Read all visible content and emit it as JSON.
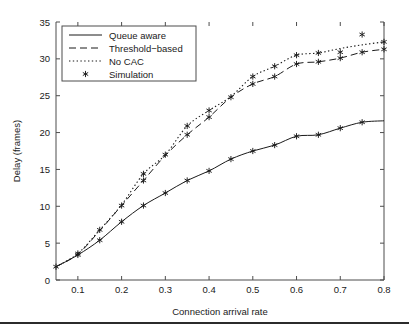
{
  "figure": {
    "background": "#ffffff",
    "foreground": "#1a1a1a",
    "footer_rule_color": "#2b2b2b"
  },
  "chart_data": {
    "type": "line",
    "title": "",
    "xlabel": "Connection arrival rate",
    "ylabel": "Delay (frames)",
    "xlim": [
      0.05,
      0.8
    ],
    "ylim": [
      0,
      35
    ],
    "xticks": [
      0.1,
      0.2,
      0.3,
      0.4,
      0.5,
      0.6,
      0.7,
      0.8
    ],
    "xticklabels": [
      "0.1",
      "0.2",
      "0.3",
      "0.4",
      "0.5",
      "0.6",
      "0.7",
      "0.8"
    ],
    "yticks": [
      0,
      5,
      10,
      15,
      20,
      25,
      30,
      35
    ],
    "yticklabels": [
      "0",
      "5",
      "10",
      "15",
      "20",
      "25",
      "30",
      "35"
    ],
    "grid": false,
    "legend_position": "upper left",
    "x": [
      0.05,
      0.1,
      0.15,
      0.2,
      0.25,
      0.3,
      0.35,
      0.4,
      0.45,
      0.5,
      0.55,
      0.6,
      0.65,
      0.7,
      0.75,
      0.8
    ],
    "series": [
      {
        "name": "Queue aware",
        "style": "solid",
        "color": "#1a1a1a",
        "values": [
          1.8,
          3.4,
          5.4,
          7.9,
          10.1,
          11.8,
          13.5,
          14.8,
          16.4,
          17.5,
          18.3,
          19.5,
          19.7,
          20.6,
          21.4,
          21.6
        ]
      },
      {
        "name": "Threshold-based",
        "style": "dashed",
        "color": "#1a1a1a",
        "values": [
          1.8,
          3.5,
          6.7,
          10.1,
          13.5,
          16.9,
          19.7,
          22.1,
          24.8,
          26.6,
          27.6,
          29.3,
          29.6,
          30.1,
          30.9,
          31.3
        ]
      },
      {
        "name": "No CAC",
        "style": "dotted",
        "color": "#1a1a1a",
        "values": [
          1.8,
          3.6,
          6.8,
          10.2,
          14.4,
          17.0,
          20.9,
          23.0,
          24.9,
          27.6,
          29.0,
          30.5,
          30.8,
          31.4,
          31.9,
          32.3
        ]
      },
      {
        "name": "Simulation",
        "style": "marker",
        "marker": "asterisk",
        "color": "#1a1a1a",
        "points": [
          {
            "x": 0.05,
            "y": 1.8
          },
          {
            "x": 0.1,
            "y": 3.4
          },
          {
            "x": 0.1,
            "y": 3.6
          },
          {
            "x": 0.15,
            "y": 5.4
          },
          {
            "x": 0.15,
            "y": 6.8
          },
          {
            "x": 0.2,
            "y": 7.9
          },
          {
            "x": 0.2,
            "y": 10.1
          },
          {
            "x": 0.25,
            "y": 10.1
          },
          {
            "x": 0.25,
            "y": 13.5
          },
          {
            "x": 0.25,
            "y": 14.4
          },
          {
            "x": 0.3,
            "y": 11.8
          },
          {
            "x": 0.3,
            "y": 17.0
          },
          {
            "x": 0.35,
            "y": 13.5
          },
          {
            "x": 0.35,
            "y": 19.7
          },
          {
            "x": 0.35,
            "y": 20.9
          },
          {
            "x": 0.4,
            "y": 14.8
          },
          {
            "x": 0.4,
            "y": 22.1
          },
          {
            "x": 0.4,
            "y": 23.0
          },
          {
            "x": 0.45,
            "y": 16.4
          },
          {
            "x": 0.45,
            "y": 24.8
          },
          {
            "x": 0.5,
            "y": 17.5
          },
          {
            "x": 0.5,
            "y": 26.6
          },
          {
            "x": 0.5,
            "y": 27.6
          },
          {
            "x": 0.55,
            "y": 18.3
          },
          {
            "x": 0.55,
            "y": 27.6
          },
          {
            "x": 0.55,
            "y": 29.0
          },
          {
            "x": 0.6,
            "y": 19.5
          },
          {
            "x": 0.6,
            "y": 29.3
          },
          {
            "x": 0.6,
            "y": 30.5
          },
          {
            "x": 0.65,
            "y": 19.7
          },
          {
            "x": 0.65,
            "y": 29.6
          },
          {
            "x": 0.65,
            "y": 30.8
          },
          {
            "x": 0.7,
            "y": 20.6
          },
          {
            "x": 0.7,
            "y": 30.1
          },
          {
            "x": 0.7,
            "y": 30.9
          },
          {
            "x": 0.75,
            "y": 21.4
          },
          {
            "x": 0.75,
            "y": 30.9
          },
          {
            "x": 0.75,
            "y": 33.3
          },
          {
            "x": 0.8,
            "y": 31.3
          },
          {
            "x": 0.8,
            "y": 32.3
          }
        ]
      }
    ],
    "legend": [
      {
        "label": "Queue aware",
        "style": "solid"
      },
      {
        "label": "Threshold−based",
        "style": "dashed"
      },
      {
        "label": "No CAC",
        "style": "dotted"
      },
      {
        "label": "Simulation",
        "style": "marker"
      }
    ]
  }
}
